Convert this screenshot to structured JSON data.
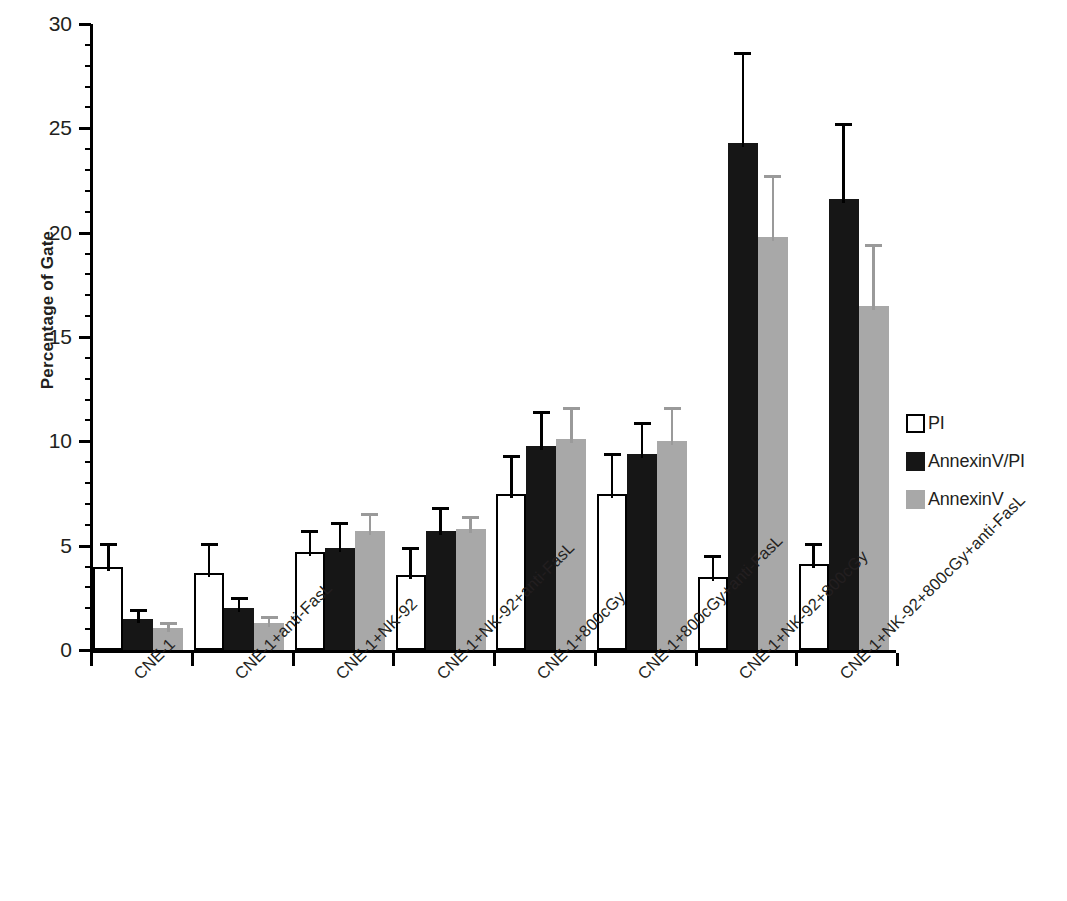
{
  "chart_data": {
    "type": "bar",
    "title": "",
    "subtitle": "",
    "xlabel": "",
    "ylabel": "Percentage of Gate",
    "ylim": [
      0,
      30
    ],
    "ytick_labels": [
      "0",
      "5",
      "10",
      "15",
      "20",
      "25",
      "30"
    ],
    "ytick_values": [
      0,
      5,
      10,
      15,
      20,
      25,
      30
    ],
    "minor_tick_step": 1,
    "grid": false,
    "legend_position": "right",
    "categories": [
      "CNE-1",
      "CNE-1+anti-FasL",
      "CNE-1+NK-92",
      "CNE-1+NK-92+anti-FasL",
      "CNE-1+800cGy",
      "CNE-1+800cGy+anti-FasL",
      "CNE-1+NK-92+800cGy",
      "CNE-1+NK-92+800cGy+anti-FasL"
    ],
    "series": [
      {
        "name": "PI",
        "color": "#ffffff",
        "edge_color": "#000000",
        "values": [
          4.0,
          3.7,
          4.7,
          3.6,
          7.5,
          7.5,
          3.5,
          4.1
        ],
        "errors": [
          1.0,
          1.3,
          0.9,
          1.2,
          1.7,
          1.8,
          0.9,
          0.9
        ]
      },
      {
        "name": "AnnexinV/PI",
        "color": "#161616",
        "edge_color": "#161616",
        "values": [
          1.5,
          2.0,
          4.9,
          5.7,
          9.8,
          9.4,
          24.3,
          21.6
        ],
        "errors": [
          0.3,
          0.4,
          1.1,
          1.0,
          1.5,
          1.4,
          4.2,
          3.5
        ]
      },
      {
        "name": "AnnexinV",
        "color": "#a8a8a8",
        "edge_color": "#a8a8a8",
        "values": [
          1.05,
          1.3,
          5.7,
          5.8,
          10.1,
          10.0,
          19.8,
          16.5
        ],
        "errors": [
          0.15,
          0.2,
          0.7,
          0.5,
          1.4,
          1.5,
          2.8,
          2.8
        ]
      }
    ]
  },
  "legend": {
    "items": [
      {
        "label": "PI",
        "swatch": "white-square-outline"
      },
      {
        "label": "AnnexinV/PI",
        "swatch": "black-square"
      },
      {
        "label": "AnnexinV",
        "swatch": "gray-square"
      }
    ]
  }
}
